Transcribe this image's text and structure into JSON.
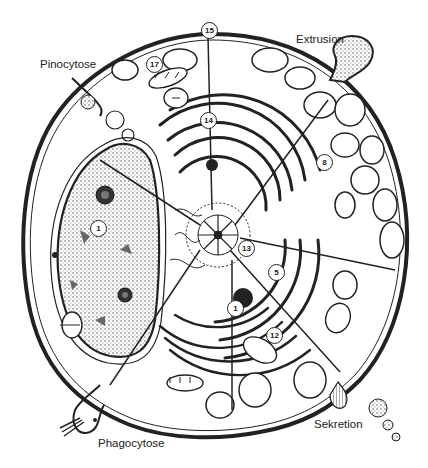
{
  "diagram": {
    "type": "cell-cross-section",
    "process_labels": {
      "pinocytose": "Pinocytose",
      "extrusion": "Extrusion",
      "phagocytose": "Phagocytose",
      "sekretion": "Sekretion"
    },
    "numbered_markers": [
      {
        "id": "m15",
        "text": "15"
      },
      {
        "id": "m17",
        "text": "17"
      },
      {
        "id": "m14",
        "text": "14"
      },
      {
        "id": "m8",
        "text": "8"
      },
      {
        "id": "m1",
        "text": "1"
      },
      {
        "id": "m13",
        "text": "13"
      },
      {
        "id": "m5",
        "text": "5"
      },
      {
        "id": "m11",
        "text": "1"
      },
      {
        "id": "m12",
        "text": "12"
      }
    ],
    "colors": {
      "ink": "#222222",
      "background": "#ffffff",
      "stipple": "#555555"
    }
  }
}
